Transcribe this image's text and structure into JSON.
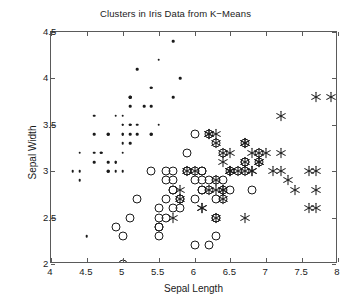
{
  "chart_data": {
    "type": "scatter",
    "title": "Clusters in Iris Data from K−Means",
    "xlabel": "Sepal Length",
    "ylabel": "Sepal Width",
    "xlim": [
      4,
      8
    ],
    "ylim": [
      2,
      4.5
    ],
    "xticks": [
      4,
      4.5,
      5,
      5.5,
      6,
      6.5,
      7,
      7.5,
      8
    ],
    "xticklabels": [
      "4",
      "4.5",
      "5",
      "5.5",
      "6",
      "6.5",
      "7",
      "7.5",
      "8"
    ],
    "yticks": [
      2,
      2.5,
      3,
      3.5,
      4,
      4.5
    ],
    "yticklabels": [
      "2",
      "2.5",
      "3",
      "3.5",
      "4",
      "4.5"
    ],
    "grid": false,
    "legend": false,
    "marker_color": "#1a1a1a",
    "axis_color": "#5a5a5a",
    "background": "#ffffff",
    "series": [
      {
        "name": "Cluster 1",
        "marker": "dot",
        "points": [
          [
            5.1,
            3.5
          ],
          [
            4.9,
            3.0
          ],
          [
            4.7,
            3.2
          ],
          [
            4.6,
            3.1
          ],
          [
            5.0,
            3.6
          ],
          [
            5.4,
            3.9
          ],
          [
            4.6,
            3.4
          ],
          [
            5.0,
            3.4
          ],
          [
            4.4,
            2.9
          ],
          [
            4.9,
            3.1
          ],
          [
            5.4,
            3.7
          ],
          [
            4.8,
            3.4
          ],
          [
            4.8,
            3.0
          ],
          [
            4.3,
            3.0
          ],
          [
            5.8,
            4.0
          ],
          [
            5.7,
            4.4
          ],
          [
            5.4,
            3.9
          ],
          [
            5.1,
            3.5
          ],
          [
            5.7,
            3.8
          ],
          [
            5.1,
            3.8
          ],
          [
            5.4,
            3.4
          ],
          [
            5.1,
            3.7
          ],
          [
            4.6,
            3.6
          ],
          [
            5.1,
            3.3
          ],
          [
            4.8,
            3.4
          ],
          [
            5.0,
            3.0
          ],
          [
            5.0,
            3.4
          ],
          [
            5.2,
            3.5
          ],
          [
            5.2,
            3.4
          ],
          [
            4.7,
            3.2
          ],
          [
            4.8,
            3.1
          ],
          [
            5.4,
            3.4
          ],
          [
            5.2,
            4.1
          ],
          [
            5.5,
            4.2
          ],
          [
            4.9,
            3.1
          ],
          [
            5.0,
            3.2
          ],
          [
            5.5,
            3.5
          ],
          [
            4.9,
            3.6
          ],
          [
            4.4,
            3.0
          ],
          [
            5.1,
            3.4
          ],
          [
            5.0,
            3.5
          ],
          [
            4.5,
            2.3
          ],
          [
            4.4,
            3.2
          ],
          [
            5.0,
            3.5
          ],
          [
            5.1,
            3.8
          ],
          [
            4.8,
            3.0
          ],
          [
            5.1,
            3.8
          ],
          [
            4.6,
            3.2
          ],
          [
            5.3,
            3.7
          ],
          [
            5.0,
            3.3
          ]
        ]
      },
      {
        "name": "Cluster 2",
        "marker": "circle",
        "points": [
          [
            5.5,
            2.3
          ],
          [
            5.7,
            2.8
          ],
          [
            4.9,
            2.4
          ],
          [
            5.2,
            2.7
          ],
          [
            5.0,
            2.0
          ],
          [
            6.0,
            2.2
          ],
          [
            6.1,
            2.9
          ],
          [
            5.6,
            2.9
          ],
          [
            5.8,
            2.7
          ],
          [
            6.2,
            2.2
          ],
          [
            5.6,
            2.5
          ],
          [
            5.9,
            3.2
          ],
          [
            6.1,
            2.8
          ],
          [
            6.3,
            2.5
          ],
          [
            6.1,
            2.8
          ],
          [
            6.4,
            2.9
          ],
          [
            6.6,
            3.0
          ],
          [
            6.8,
            2.8
          ],
          [
            6.7,
            3.0
          ],
          [
            6.0,
            2.9
          ],
          [
            5.7,
            2.6
          ],
          [
            5.5,
            2.4
          ],
          [
            5.5,
            2.4
          ],
          [
            5.8,
            2.7
          ],
          [
            6.0,
            2.7
          ],
          [
            5.4,
            3.0
          ],
          [
            6.0,
            3.4
          ],
          [
            6.7,
            3.1
          ],
          [
            6.3,
            2.3
          ],
          [
            5.6,
            3.0
          ],
          [
            5.5,
            2.5
          ],
          [
            5.5,
            2.6
          ],
          [
            6.1,
            3.0
          ],
          [
            5.8,
            2.6
          ],
          [
            5.0,
            2.3
          ],
          [
            5.6,
            2.7
          ],
          [
            5.7,
            3.0
          ],
          [
            5.7,
            2.9
          ],
          [
            6.2,
            2.9
          ],
          [
            5.1,
            2.5
          ],
          [
            5.7,
            2.8
          ],
          [
            6.3,
            3.3
          ],
          [
            6.5,
            2.8
          ],
          [
            6.4,
            3.2
          ],
          [
            6.3,
            2.9
          ],
          [
            6.9,
            3.2
          ],
          [
            6.3,
            2.7
          ],
          [
            6.7,
            3.3
          ],
          [
            6.2,
            2.8
          ],
          [
            6.1,
            3.0
          ],
          [
            6.4,
            2.8
          ],
          [
            6.0,
            3.0
          ],
          [
            6.9,
            3.1
          ],
          [
            6.7,
            3.1
          ],
          [
            5.9,
            3.0
          ],
          [
            6.3,
            2.5
          ],
          [
            6.5,
            3.0
          ],
          [
            6.2,
            3.4
          ],
          [
            5.9,
            3.0
          ],
          [
            6.4,
            2.7
          ]
        ]
      },
      {
        "name": "Cluster 3",
        "marker": "asterisk",
        "points": [
          [
            6.3,
            3.3
          ],
          [
            7.1,
            3.0
          ],
          [
            6.3,
            2.9
          ],
          [
            6.5,
            3.0
          ],
          [
            7.6,
            3.0
          ],
          [
            7.3,
            2.9
          ],
          [
            6.7,
            2.5
          ],
          [
            7.2,
            3.6
          ],
          [
            6.5,
            3.2
          ],
          [
            6.4,
            2.7
          ],
          [
            6.8,
            3.0
          ],
          [
            5.7,
            2.5
          ],
          [
            5.8,
            2.8
          ],
          [
            6.4,
            3.2
          ],
          [
            6.5,
            3.0
          ],
          [
            7.7,
            3.8
          ],
          [
            7.7,
            2.6
          ],
          [
            6.9,
            3.2
          ],
          [
            7.7,
            2.8
          ],
          [
            6.7,
            3.3
          ],
          [
            7.2,
            3.2
          ],
          [
            6.2,
            2.8
          ],
          [
            6.1,
            2.6
          ],
          [
            6.4,
            2.8
          ],
          [
            7.2,
            3.0
          ],
          [
            7.4,
            2.8
          ],
          [
            7.9,
            3.8
          ],
          [
            6.4,
            2.8
          ],
          [
            6.3,
            2.8
          ],
          [
            6.1,
            2.6
          ],
          [
            7.7,
            3.0
          ],
          [
            6.3,
            3.4
          ],
          [
            6.4,
            3.1
          ],
          [
            6.0,
            3.0
          ],
          [
            6.9,
            3.1
          ],
          [
            6.7,
            3.1
          ],
          [
            6.9,
            3.1
          ],
          [
            5.8,
            2.7
          ],
          [
            6.8,
            3.2
          ],
          [
            6.7,
            3.3
          ],
          [
            6.7,
            3.0
          ],
          [
            6.3,
            2.5
          ],
          [
            6.5,
            3.0
          ],
          [
            6.2,
            3.4
          ],
          [
            5.9,
            3.0
          ],
          [
            6.2,
            3.4
          ],
          [
            7.0,
            3.2
          ],
          [
            6.6,
            3.0
          ],
          [
            7.6,
            2.6
          ],
          [
            6.8,
            3.0
          ]
        ]
      }
    ]
  }
}
